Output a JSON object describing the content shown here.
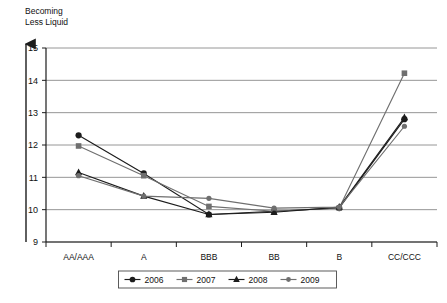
{
  "chart_data": {
    "type": "line",
    "title": "Becoming\nLess Liquid",
    "xlabel": "",
    "ylabel": "",
    "categories": [
      "AA/AAA",
      "A",
      "BBB",
      "BB",
      "B",
      "CC/CCC"
    ],
    "ylim": [
      9,
      15
    ],
    "yticks": [
      9,
      10,
      11,
      12,
      13,
      14,
      15
    ],
    "grid": true,
    "legend_position": "bottom",
    "series": [
      {
        "name": "2006",
        "marker": "circle",
        "color": "#1c1c1c",
        "values": [
          12.3,
          11.12,
          9.85,
          9.95,
          10.05,
          12.8
        ]
      },
      {
        "name": "2007",
        "marker": "square",
        "color": "#6f6f6f",
        "values": [
          11.97,
          11.05,
          10.1,
          9.95,
          10.05,
          14.22
        ]
      },
      {
        "name": "2008",
        "marker": "triangle",
        "color": "#1c1c1c",
        "values": [
          11.15,
          10.42,
          9.85,
          9.92,
          10.08,
          12.85
        ]
      },
      {
        "name": "2009",
        "marker": "dot",
        "color": "#6f6f6f",
        "values": [
          11.05,
          10.42,
          10.35,
          10.05,
          10.08,
          12.58
        ]
      }
    ]
  },
  "legend": {
    "entries": [
      "2006",
      "2007",
      "2008",
      "2009"
    ]
  },
  "axes": {
    "y_arrow": "up-arrow-icon"
  }
}
